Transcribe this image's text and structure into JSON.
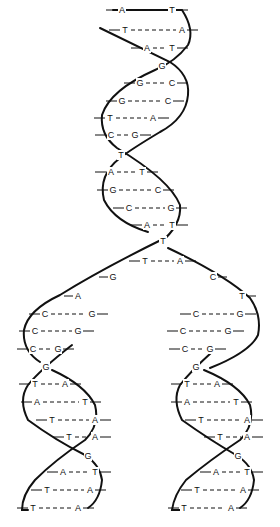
{
  "diagram": {
    "colors": {
      "ink": "#111111",
      "background": "#ffffff"
    },
    "parent_helix": {
      "pairs": [
        {
          "y": 10,
          "left": "A",
          "right": "T",
          "lx": 122,
          "rx": 172
        },
        {
          "y": 30,
          "left": "T",
          "right": "A",
          "lx": 125,
          "rx": 182
        },
        {
          "y": 48,
          "left": "A",
          "right": "T",
          "lx": 147,
          "rx": 172
        },
        {
          "y": 66,
          "single": "G",
          "x": 162
        },
        {
          "y": 83,
          "left": "G",
          "right": "C",
          "lx": 140,
          "rx": 172
        },
        {
          "y": 101,
          "left": "G",
          "right": "C",
          "lx": 122,
          "rx": 168
        },
        {
          "y": 118,
          "left": "T",
          "right": "A",
          "lx": 110,
          "rx": 153
        },
        {
          "y": 135,
          "left": "C",
          "right": "G",
          "lx": 111,
          "rx": 135
        },
        {
          "y": 155,
          "single": "T",
          "x": 121
        },
        {
          "y": 172,
          "left": "A",
          "right": "T",
          "lx": 111,
          "rx": 142
        },
        {
          "y": 190,
          "left": "G",
          "right": "C",
          "lx": 113,
          "rx": 158
        },
        {
          "y": 208,
          "left": "C",
          "right": "G",
          "lx": 129,
          "rx": 171
        },
        {
          "y": 225,
          "left": "A",
          "right": "T",
          "lx": 147,
          "rx": 172
        }
      ]
    },
    "fork": {
      "junction": {
        "y": 241,
        "label": "T",
        "x": 163
      },
      "left_arm": [
        {
          "y": 261,
          "left": "T",
          "right": "A",
          "lx": 145,
          "rx": 180
        },
        {
          "y": 277,
          "label": "G",
          "x": 113
        },
        {
          "y": 296,
          "label": "A",
          "x": 78
        }
      ],
      "right_arm": [
        {
          "y": 277,
          "label": "C",
          "x": 213
        },
        {
          "y": 296,
          "label": "T",
          "x": 242
        }
      ]
    },
    "daughter_left": {
      "pairs": [
        {
          "y": 314,
          "left": "C",
          "right": "G",
          "lx": 45,
          "rx": 92
        },
        {
          "y": 331,
          "left": "C",
          "right": "G",
          "lx": 35,
          "rx": 78
        },
        {
          "y": 349,
          "left": "C",
          "right": "G",
          "lx": 33,
          "rx": 58
        },
        {
          "y": 367,
          "single": "G",
          "x": 46
        },
        {
          "y": 384,
          "left": "T",
          "right": "A",
          "lx": 35,
          "rx": 65
        },
        {
          "y": 402,
          "left": "A",
          "right": "T",
          "lx": 37,
          "rx": 85
        },
        {
          "y": 420,
          "left": "T",
          "right": "A",
          "lx": 52,
          "rx": 95
        },
        {
          "y": 437,
          "left": "T",
          "right": "A",
          "lx": 69,
          "rx": 95
        },
        {
          "y": 456,
          "single": "G",
          "x": 88
        },
        {
          "y": 472,
          "left": "A",
          "right": "T",
          "lx": 63,
          "rx": 95
        },
        {
          "y": 490,
          "left": "T",
          "right": "A",
          "lx": 47,
          "rx": 90
        },
        {
          "y": 508,
          "left": "T",
          "right": "A",
          "lx": 33,
          "rx": 78
        }
      ]
    },
    "daughter_right": {
      "pairs": [
        {
          "y": 314,
          "left": "C",
          "right": "G",
          "lx": 196,
          "rx": 240
        },
        {
          "y": 331,
          "left": "C",
          "right": "G",
          "lx": 183,
          "rx": 228
        },
        {
          "y": 349,
          "left": "C",
          "right": "G",
          "lx": 185,
          "rx": 210
        },
        {
          "y": 367,
          "single": "G",
          "x": 196
        },
        {
          "y": 384,
          "left": "T",
          "right": "A",
          "lx": 187,
          "rx": 217
        },
        {
          "y": 402,
          "left": "A",
          "right": "T",
          "lx": 187,
          "rx": 236
        },
        {
          "y": 420,
          "left": "T",
          "right": "A",
          "lx": 201,
          "rx": 247
        },
        {
          "y": 437,
          "left": "T",
          "right": "A",
          "lx": 220,
          "rx": 247
        },
        {
          "y": 456,
          "single": "G",
          "x": 238
        },
        {
          "y": 472,
          "left": "A",
          "right": "T",
          "lx": 216,
          "rx": 247
        },
        {
          "y": 490,
          "left": "T",
          "right": "A",
          "lx": 197,
          "rx": 243
        },
        {
          "y": 508,
          "left": "T",
          "right": "A",
          "lx": 184,
          "rx": 231
        }
      ]
    }
  }
}
